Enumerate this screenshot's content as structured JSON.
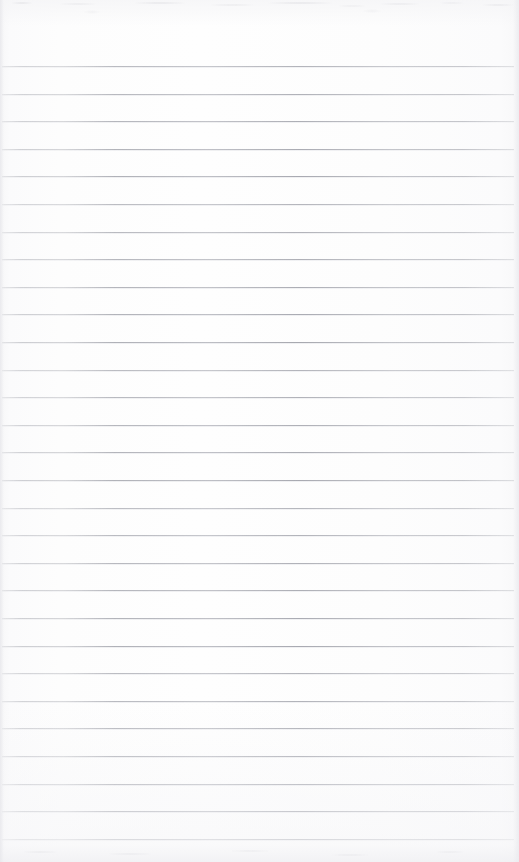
{
  "document": {
    "type": "scanned-lined-paper",
    "title": "Blank ruled notebook page",
    "width": 519,
    "height": 862,
    "text_content": "",
    "visible_text": []
  },
  "paper": {
    "background_color": "#fdfdfd",
    "edge_tone_color": "#f3f3f5",
    "has_visible_writing": false,
    "has_margin_rule": false,
    "has_header": false,
    "has_page_number": false
  },
  "ruling": {
    "line_color": "#8e9098",
    "line_count": 29,
    "first_line_y": 66,
    "line_spacing": 27.6,
    "line_start_x": 2,
    "line_end_x": 514,
    "lines": [
      {
        "index": 1,
        "y": 66,
        "x1": 2,
        "x2": 514
      },
      {
        "index": 2,
        "y": 94,
        "x1": 2,
        "x2": 514
      },
      {
        "index": 3,
        "y": 121,
        "x1": 2,
        "x2": 514
      },
      {
        "index": 4,
        "y": 149,
        "x1": 2,
        "x2": 514
      },
      {
        "index": 5,
        "y": 176,
        "x1": 2,
        "x2": 514
      },
      {
        "index": 6,
        "y": 204,
        "x1": 2,
        "x2": 514
      },
      {
        "index": 7,
        "y": 232,
        "x1": 2,
        "x2": 514
      },
      {
        "index": 8,
        "y": 259,
        "x1": 2,
        "x2": 514
      },
      {
        "index": 9,
        "y": 287,
        "x1": 2,
        "x2": 514
      },
      {
        "index": 10,
        "y": 314,
        "x1": 2,
        "x2": 514
      },
      {
        "index": 11,
        "y": 342,
        "x1": 2,
        "x2": 514
      },
      {
        "index": 12,
        "y": 370,
        "x1": 2,
        "x2": 514
      },
      {
        "index": 13,
        "y": 397,
        "x1": 2,
        "x2": 514
      },
      {
        "index": 14,
        "y": 425,
        "x1": 2,
        "x2": 514
      },
      {
        "index": 15,
        "y": 452,
        "x1": 2,
        "x2": 514
      },
      {
        "index": 16,
        "y": 480,
        "x1": 2,
        "x2": 514
      },
      {
        "index": 17,
        "y": 508,
        "x1": 2,
        "x2": 514
      },
      {
        "index": 18,
        "y": 535,
        "x1": 2,
        "x2": 514
      },
      {
        "index": 19,
        "y": 563,
        "x1": 2,
        "x2": 514
      },
      {
        "index": 20,
        "y": 590,
        "x1": 2,
        "x2": 514
      },
      {
        "index": 21,
        "y": 618,
        "x1": 2,
        "x2": 514
      },
      {
        "index": 22,
        "y": 646,
        "x1": 2,
        "x2": 514
      },
      {
        "index": 23,
        "y": 673,
        "x1": 2,
        "x2": 514
      },
      {
        "index": 24,
        "y": 701,
        "x1": 2,
        "x2": 514
      },
      {
        "index": 25,
        "y": 728,
        "x1": 2,
        "x2": 514
      },
      {
        "index": 26,
        "y": 756,
        "x1": 2,
        "x2": 514
      },
      {
        "index": 27,
        "y": 784,
        "x1": 2,
        "x2": 514
      },
      {
        "index": 28,
        "y": 811,
        "x1": 2,
        "x2": 514
      },
      {
        "index": 29,
        "y": 839,
        "x1": 2,
        "x2": 514
      }
    ]
  },
  "artifacts": {
    "top_noise_band": true,
    "bottom_noise_band": true,
    "left_edge_band": true,
    "right_edge_band": true
  }
}
